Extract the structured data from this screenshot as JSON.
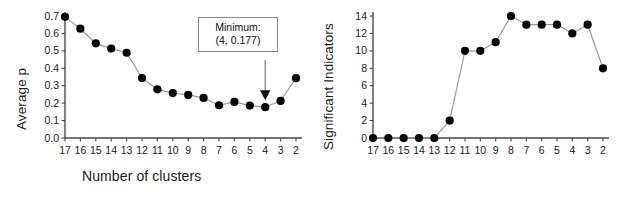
{
  "figure": {
    "background_color": "#ffffff",
    "marker_color": "#000000",
    "line_color": "#9a9a9a",
    "axis_color": "#4a4a4a",
    "text_color": "#1a1a1a"
  },
  "panels": {
    "left": {
      "ytitle": "Average p",
      "xtitle": "Number of clusters",
      "annotation": {
        "line1": "Minimum:",
        "line2": "(4, 0.177)"
      }
    },
    "right": {
      "ytitle": "Significant Indicators",
      "xtitle": "Number of clusters"
    }
  },
  "chart_data": [
    {
      "type": "line",
      "title": "",
      "xlabel": "Number of clusters",
      "ylabel": "Average p",
      "categories": [
        "17",
        "16",
        "15",
        "14",
        "13",
        "12",
        "11",
        "10",
        "9",
        "8",
        "7",
        "6",
        "5",
        "4",
        "3",
        "2"
      ],
      "x": [
        17,
        16,
        15,
        14,
        13,
        12,
        11,
        10,
        9,
        8,
        7,
        6,
        5,
        4,
        3,
        2
      ],
      "values": [
        0.695,
        0.627,
        0.543,
        0.513,
        0.489,
        0.344,
        0.279,
        0.258,
        0.247,
        0.23,
        0.188,
        0.207,
        0.186,
        0.177,
        0.213,
        0.343
      ],
      "ylim": [
        0.0,
        0.7
      ],
      "yticks": [
        "0.0",
        "0.1",
        "0.2",
        "0.3",
        "0.4",
        "0.5",
        "0.6",
        "0.7"
      ],
      "ytick_values": [
        0.0,
        0.1,
        0.2,
        0.3,
        0.4,
        0.5,
        0.6,
        0.7
      ],
      "grid": false,
      "legend": false,
      "x_axis_direction": "descending",
      "annotations": [
        {
          "text": "Minimum: (4, 0.177)",
          "points_to_x": 4,
          "points_to_y": 0.177,
          "has_arrow": true
        }
      ]
    },
    {
      "type": "line",
      "title": "",
      "xlabel": "Number of clusters",
      "ylabel": "Significant Indicators",
      "categories": [
        "17",
        "16",
        "15",
        "14",
        "13",
        "12",
        "11",
        "10",
        "9",
        "8",
        "7",
        "6",
        "5",
        "4",
        "3",
        "2"
      ],
      "x": [
        17,
        16,
        15,
        14,
        13,
        12,
        11,
        10,
        9,
        8,
        7,
        6,
        5,
        4,
        3,
        2
      ],
      "values": [
        0,
        0,
        0,
        0,
        0,
        2,
        10,
        10,
        11,
        14,
        13,
        13,
        13,
        12,
        13,
        8
      ],
      "ylim": [
        0,
        14
      ],
      "yticks": [
        "0",
        "2",
        "4",
        "6",
        "8",
        "10",
        "12",
        "14"
      ],
      "ytick_values": [
        0,
        2,
        4,
        6,
        8,
        10,
        12,
        14
      ],
      "grid": false,
      "legend": false,
      "x_axis_direction": "descending"
    }
  ]
}
